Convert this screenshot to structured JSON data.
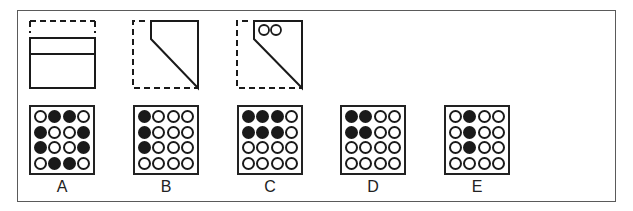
{
  "question": {
    "panels": [
      {
        "id": "panel-1",
        "description": "unfolded paper with dashed top edge and fold line"
      },
      {
        "id": "panel-2",
        "description": "paper folded diagonally, dashed outline of original square"
      },
      {
        "id": "panel-3",
        "description": "folded paper with two punched holes in top-left corner"
      }
    ]
  },
  "options": [
    {
      "label": "A",
      "left": 29,
      "grid": [
        [
          0,
          1,
          1,
          0
        ],
        [
          1,
          0,
          0,
          1
        ],
        [
          1,
          0,
          0,
          1
        ],
        [
          0,
          1,
          1,
          0
        ]
      ]
    },
    {
      "label": "B",
      "left": 133,
      "grid": [
        [
          1,
          0,
          0,
          0
        ],
        [
          1,
          0,
          0,
          0
        ],
        [
          1,
          0,
          0,
          0
        ],
        [
          0,
          0,
          0,
          0
        ]
      ]
    },
    {
      "label": "C",
      "left": 237,
      "grid": [
        [
          1,
          1,
          1,
          0
        ],
        [
          1,
          1,
          1,
          0
        ],
        [
          0,
          0,
          0,
          0
        ],
        [
          0,
          0,
          0,
          0
        ]
      ]
    },
    {
      "label": "D",
      "left": 340,
      "grid": [
        [
          1,
          1,
          0,
          0
        ],
        [
          1,
          1,
          0,
          0
        ],
        [
          0,
          0,
          0,
          0
        ],
        [
          0,
          0,
          0,
          0
        ]
      ]
    },
    {
      "label": "E",
      "left": 444,
      "grid": [
        [
          0,
          1,
          0,
          0
        ],
        [
          0,
          1,
          0,
          0
        ],
        [
          0,
          1,
          0,
          0
        ],
        [
          0,
          0,
          0,
          0
        ]
      ]
    }
  ],
  "colors": {
    "ink": "#1a1a1a",
    "frame": "#5a5a5a",
    "background": "#ffffff"
  }
}
